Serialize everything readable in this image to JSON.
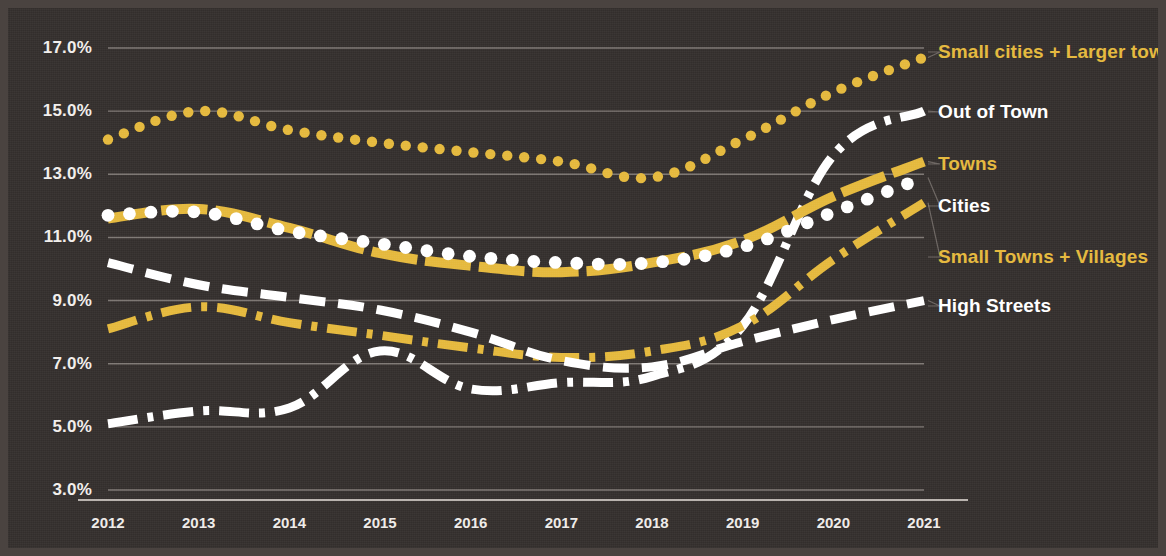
{
  "chart_data": {
    "type": "line",
    "title": "",
    "subtitle": "",
    "xlabel": "",
    "ylabel": "",
    "categories": [
      "2012",
      "2013",
      "2014",
      "2015",
      "2016",
      "2017",
      "2018",
      "2019",
      "2020",
      "2021"
    ],
    "x": [
      2012,
      2013,
      2014,
      2015,
      2016,
      2017,
      2018,
      2019,
      2020,
      2021
    ],
    "ylim": [
      3.0,
      17.0
    ],
    "xlim": [
      2012,
      2021
    ],
    "yticks": [
      "3.0%",
      "5.0%",
      "7.0%",
      "9.0%",
      "11.0%",
      "13.0%",
      "15.0%",
      "17.0%"
    ],
    "ytick_values": [
      3.0,
      5.0,
      7.0,
      9.0,
      11.0,
      13.0,
      15.0,
      17.0
    ],
    "grid": "horizontal",
    "legend_position": "right",
    "value_suffix": "%",
    "series": [
      {
        "name": "Small cities + Larger towns",
        "color": "#e5b93c",
        "style": "dotted",
        "values": [
          14.1,
          15.0,
          14.4,
          14.0,
          13.7,
          13.4,
          12.9,
          14.1,
          15.6,
          16.7
        ]
      },
      {
        "name": "Out of Town",
        "color": "#ffffff",
        "style": "dash-dot",
        "values": [
          5.1,
          5.5,
          5.6,
          7.4,
          6.2,
          6.4,
          6.6,
          8.2,
          13.6,
          15.0
        ]
      },
      {
        "name": "Towns",
        "color": "#e5b93c",
        "style": "solid-dashed",
        "values": [
          11.6,
          11.9,
          11.3,
          10.5,
          10.1,
          9.9,
          10.2,
          10.9,
          12.3,
          13.4
        ]
      },
      {
        "name": "Cities",
        "color": "#ffffff",
        "style": "dotted",
        "values": [
          11.7,
          11.8,
          11.2,
          10.8,
          10.4,
          10.2,
          10.2,
          10.7,
          11.8,
          12.9
        ]
      },
      {
        "name": "Small Towns + Villages",
        "color": "#e5b93c",
        "style": "dash-dot",
        "values": [
          8.1,
          8.8,
          8.3,
          7.9,
          7.5,
          7.2,
          7.4,
          8.2,
          10.3,
          12.1
        ]
      },
      {
        "name": "High Streets",
        "color": "#ffffff",
        "style": "dashed",
        "values": [
          10.2,
          9.5,
          9.1,
          8.7,
          8.0,
          7.1,
          6.9,
          7.7,
          8.4,
          9.0
        ]
      }
    ]
  },
  "axes": {
    "y_ticks": [
      {
        "label": "17.0%"
      },
      {
        "label": "15.0%"
      },
      {
        "label": "13.0%"
      },
      {
        "label": "11.0%"
      },
      {
        "label": "9.0%"
      },
      {
        "label": "7.0%"
      },
      {
        "label": "5.0%"
      },
      {
        "label": "3.0%"
      }
    ],
    "x_ticks": [
      {
        "label": "2012"
      },
      {
        "label": "2013"
      },
      {
        "label": "2014"
      },
      {
        "label": "2015"
      },
      {
        "label": "2016"
      },
      {
        "label": "2017"
      },
      {
        "label": "2018"
      },
      {
        "label": "2019"
      },
      {
        "label": "2020"
      },
      {
        "label": "2021"
      }
    ]
  },
  "legend": {
    "items": [
      {
        "label": "Small cities + Larger towns",
        "color": "#e5b93c"
      },
      {
        "label": "Out of Town",
        "color": "#ffffff"
      },
      {
        "label": "Towns",
        "color": "#e5b93c"
      },
      {
        "label": "Cities",
        "color": "#ffffff"
      },
      {
        "label": "Small Towns + Villages",
        "color": "#e5b93c"
      },
      {
        "label": "High Streets",
        "color": "#ffffff"
      }
    ]
  },
  "theme": {
    "background": "#332e2c",
    "frame": "#4a4340",
    "gridline": "#8b8480",
    "accent_gold": "#e5b93c",
    "accent_white": "#ffffff",
    "text": "#f2efec"
  }
}
